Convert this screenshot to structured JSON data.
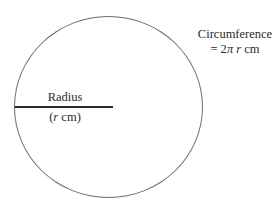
{
  "diagram": {
    "radius": {
      "label": "Radius",
      "paren_open": "(",
      "symbol": "r",
      "unit": " cm)"
    },
    "circumference": {
      "label": "Circumference",
      "eq": "= 2",
      "pi": "π ",
      "symbol": "r",
      "unit": " cm"
    },
    "colors": {
      "circle_stroke": "#6e6e6e",
      "radius_line": "#2a2a2a",
      "text": "#2b2b2b",
      "background": "#ffffff"
    }
  }
}
